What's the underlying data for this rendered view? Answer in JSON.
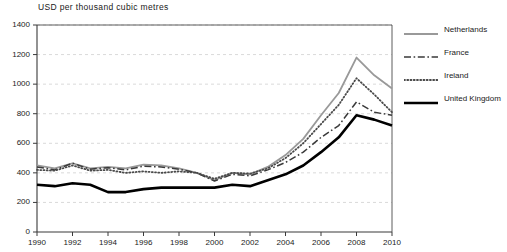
{
  "chart_data": {
    "type": "line",
    "title": "USD per thousand cubic metres",
    "xlabel": "",
    "ylabel": "USD per thousand cubic metres",
    "xlim": [
      1990,
      2010
    ],
    "ylim": [
      0,
      1400
    ],
    "ytick_step": 200,
    "xtick_step": 2,
    "grid": true,
    "legend_position": "top-right",
    "x": [
      1990,
      1991,
      1992,
      1993,
      1994,
      1995,
      1996,
      1997,
      1998,
      1999,
      2000,
      2001,
      2002,
      2003,
      2004,
      2005,
      2006,
      2007,
      2008,
      2009,
      2010
    ],
    "yticks": [
      0,
      200,
      400,
      600,
      800,
      1000,
      1200,
      1400
    ],
    "xticks": [
      1990,
      1992,
      1994,
      1996,
      1998,
      2000,
      2002,
      2004,
      2006,
      2008,
      2010
    ],
    "series": [
      {
        "name": "Netherlands",
        "color": "#999999",
        "style": "solid",
        "width": 1.8,
        "values": [
          450,
          430,
          465,
          430,
          440,
          430,
          455,
          450,
          430,
          400,
          350,
          400,
          390,
          440,
          520,
          630,
          790,
          940,
          1180,
          1060,
          970
        ]
      },
      {
        "name": "France",
        "color": "#3a3a3a",
        "style": "dashdot",
        "width": 1.5,
        "values": [
          440,
          420,
          465,
          425,
          435,
          420,
          445,
          440,
          425,
          400,
          345,
          390,
          380,
          420,
          470,
          540,
          640,
          720,
          880,
          810,
          790
        ]
      },
      {
        "name": "Ireland",
        "color": "#4a4a4a",
        "style": "dotted",
        "width": 1.8,
        "values": [
          420,
          415,
          450,
          415,
          420,
          400,
          410,
          400,
          410,
          400,
          360,
          400,
          395,
          430,
          500,
          600,
          730,
          860,
          1040,
          930,
          810
        ]
      },
      {
        "name": "United Kingdom",
        "color": "#000000",
        "style": "solid",
        "width": 2.6,
        "values": [
          320,
          310,
          330,
          320,
          270,
          270,
          290,
          300,
          300,
          300,
          300,
          320,
          310,
          350,
          390,
          450,
          540,
          640,
          790,
          760,
          720
        ]
      }
    ]
  }
}
